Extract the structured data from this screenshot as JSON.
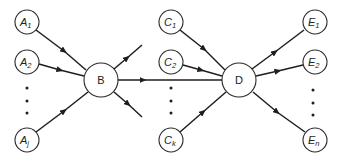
{
  "diagram": {
    "type": "flow-network",
    "colors": {
      "stroke": "#1e1e1e",
      "background": "#ffffff"
    },
    "nodes": {
      "A1": {
        "letter": "A",
        "sub": "1"
      },
      "A2": {
        "letter": "A",
        "sub": "2"
      },
      "Aj": {
        "letter": "A",
        "sub": "j"
      },
      "B": {
        "letter": "B"
      },
      "C1": {
        "letter": "C",
        "sub": "1"
      },
      "C2": {
        "letter": "C",
        "sub": "2"
      },
      "Ck": {
        "letter": "C",
        "sub": "k"
      },
      "D": {
        "letter": "D"
      },
      "E1": {
        "letter": "E",
        "sub": "1"
      },
      "E2": {
        "letter": "E",
        "sub": "2"
      },
      "En": {
        "letter": "E",
        "sub": "n"
      }
    },
    "edges": [
      {
        "from": "A1",
        "to": "B"
      },
      {
        "from": "A2",
        "to": "B"
      },
      {
        "from": "Aj",
        "to": "B"
      },
      {
        "from": "B",
        "to": "out-up"
      },
      {
        "from": "B",
        "to": "D"
      },
      {
        "from": "B",
        "to": "out-down"
      },
      {
        "from": "C1",
        "to": "D"
      },
      {
        "from": "C2",
        "to": "D"
      },
      {
        "from": "Ck",
        "to": "D"
      },
      {
        "from": "D",
        "to": "E1"
      },
      {
        "from": "D",
        "to": "E2"
      },
      {
        "from": "D",
        "to": "En"
      }
    ],
    "ellipsis": "⋮"
  }
}
